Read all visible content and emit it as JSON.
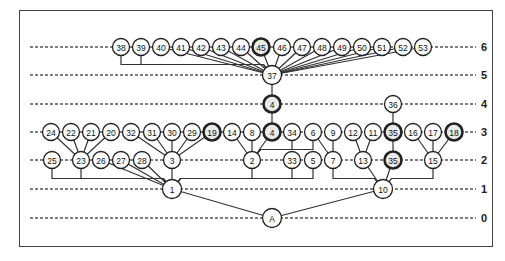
{
  "diagram": {
    "type": "hierarchical-tree",
    "levels": [
      {
        "label": "6",
        "y": 47
      },
      {
        "label": "5",
        "y": 75
      },
      {
        "label": "4",
        "y": 104
      },
      {
        "label": "3",
        "y": 132
      },
      {
        "label": "2",
        "y": 160
      },
      {
        "label": "1",
        "y": 189
      },
      {
        "label": "0",
        "y": 218
      }
    ],
    "nodes": [
      {
        "id": "38",
        "label": "38",
        "level": 6,
        "x": 121
      },
      {
        "id": "39",
        "label": "39",
        "level": 6,
        "x": 141
      },
      {
        "id": "40",
        "label": "40",
        "level": 6,
        "x": 161
      },
      {
        "id": "41",
        "label": "41",
        "level": 6,
        "x": 181
      },
      {
        "id": "42",
        "label": "42",
        "level": 6,
        "x": 201
      },
      {
        "id": "43",
        "label": "43",
        "level": 6,
        "x": 221
      },
      {
        "id": "44",
        "label": "44",
        "level": 6,
        "x": 241
      },
      {
        "id": "45",
        "label": "45",
        "level": 6,
        "x": 261,
        "dark": true
      },
      {
        "id": "46",
        "label": "46",
        "level": 6,
        "x": 282
      },
      {
        "id": "47",
        "label": "47",
        "level": 6,
        "x": 302
      },
      {
        "id": "48",
        "label": "48",
        "level": 6,
        "x": 322
      },
      {
        "id": "49",
        "label": "49",
        "level": 6,
        "x": 342
      },
      {
        "id": "50",
        "label": "50",
        "level": 6,
        "x": 362
      },
      {
        "id": "51",
        "label": "51",
        "level": 6,
        "x": 382
      },
      {
        "id": "52",
        "label": "52",
        "level": 6,
        "x": 403
      },
      {
        "id": "53",
        "label": "53",
        "level": 6,
        "x": 423
      },
      {
        "id": "37",
        "label": "37",
        "level": 5,
        "x": 272
      },
      {
        "id": "4a",
        "label": "4",
        "level": 4,
        "x": 272,
        "dark": true
      },
      {
        "id": "36",
        "label": "36",
        "level": 4,
        "x": 393
      },
      {
        "id": "24",
        "label": "24",
        "level": 3,
        "x": 51
      },
      {
        "id": "22",
        "label": "22",
        "level": 3,
        "x": 71
      },
      {
        "id": "21",
        "label": "21",
        "level": 3,
        "x": 91
      },
      {
        "id": "20",
        "label": "20",
        "level": 3,
        "x": 111
      },
      {
        "id": "32",
        "label": "32",
        "level": 3,
        "x": 131
      },
      {
        "id": "31",
        "label": "31",
        "level": 3,
        "x": 152
      },
      {
        "id": "30",
        "label": "30",
        "level": 3,
        "x": 172
      },
      {
        "id": "29",
        "label": "29",
        "level": 3,
        "x": 192
      },
      {
        "id": "19",
        "label": "19",
        "level": 3,
        "x": 212,
        "dark": true
      },
      {
        "id": "14",
        "label": "14",
        "level": 3,
        "x": 232
      },
      {
        "id": "8",
        "label": "8",
        "level": 3,
        "x": 252
      },
      {
        "id": "4b",
        "label": "4",
        "level": 3,
        "x": 272,
        "dark": true
      },
      {
        "id": "34",
        "label": "34",
        "level": 3,
        "x": 292
      },
      {
        "id": "6",
        "label": "6",
        "level": 3,
        "x": 313
      },
      {
        "id": "9",
        "label": "9",
        "level": 3,
        "x": 333
      },
      {
        "id": "12",
        "label": "12",
        "level": 3,
        "x": 353
      },
      {
        "id": "11",
        "label": "11",
        "level": 3,
        "x": 373
      },
      {
        "id": "35a",
        "label": "35",
        "level": 3,
        "x": 393,
        "dark": true
      },
      {
        "id": "16",
        "label": "16",
        "level": 3,
        "x": 413
      },
      {
        "id": "17",
        "label": "17",
        "level": 3,
        "x": 433
      },
      {
        "id": "18",
        "label": "18",
        "level": 3,
        "x": 454,
        "dark": true
      },
      {
        "id": "25",
        "label": "25",
        "level": 2,
        "x": 52
      },
      {
        "id": "23",
        "label": "23",
        "level": 2,
        "x": 81
      },
      {
        "id": "26",
        "label": "26",
        "level": 2,
        "x": 101
      },
      {
        "id": "27",
        "label": "27",
        "level": 2,
        "x": 121
      },
      {
        "id": "28",
        "label": "28",
        "level": 2,
        "x": 142
      },
      {
        "id": "3",
        "label": "3",
        "level": 2,
        "x": 172
      },
      {
        "id": "2",
        "label": "2",
        "level": 2,
        "x": 252
      },
      {
        "id": "33",
        "label": "33",
        "level": 2,
        "x": 292
      },
      {
        "id": "5",
        "label": "5",
        "level": 2,
        "x": 313
      },
      {
        "id": "7",
        "label": "7",
        "level": 2,
        "x": 333
      },
      {
        "id": "13",
        "label": "13",
        "level": 2,
        "x": 363
      },
      {
        "id": "35b",
        "label": "35",
        "level": 2,
        "x": 393,
        "dark": true
      },
      {
        "id": "15",
        "label": "15",
        "level": 2,
        "x": 433
      },
      {
        "id": "1",
        "label": "1",
        "level": 1,
        "x": 172
      },
      {
        "id": "10",
        "label": "10",
        "level": 1,
        "x": 383
      },
      {
        "id": "A",
        "label": "A",
        "level": 0,
        "x": 272
      }
    ],
    "edges": [
      [
        "38",
        "37",
        "elbow"
      ],
      [
        "39",
        "37",
        "elbow"
      ],
      [
        "40",
        "37"
      ],
      [
        "41",
        "37"
      ],
      [
        "42",
        "37"
      ],
      [
        "43",
        "37"
      ],
      [
        "44",
        "37"
      ],
      [
        "45",
        "37"
      ],
      [
        "46",
        "37"
      ],
      [
        "47",
        "37"
      ],
      [
        "48",
        "37"
      ],
      [
        "49",
        "37"
      ],
      [
        "50",
        "37"
      ],
      [
        "51",
        "37"
      ],
      [
        "52",
        "37"
      ],
      [
        "53",
        "37"
      ],
      [
        "37",
        "4a"
      ],
      [
        "4a",
        "4b"
      ],
      [
        "36",
        "35a"
      ],
      [
        "35a",
        "35b"
      ],
      [
        "24",
        "23"
      ],
      [
        "22",
        "23"
      ],
      [
        "21",
        "23"
      ],
      [
        "20",
        "23"
      ],
      [
        "32",
        "3"
      ],
      [
        "31",
        "3"
      ],
      [
        "30",
        "3"
      ],
      [
        "29",
        "3"
      ],
      [
        "19",
        "3"
      ],
      [
        "14",
        "2"
      ],
      [
        "8",
        "2"
      ],
      [
        "4b",
        "2"
      ],
      [
        "34",
        "2",
        "elbow"
      ],
      [
        "6",
        "2",
        "elbow"
      ],
      [
        "6",
        "7"
      ],
      [
        "9",
        "7"
      ],
      [
        "12",
        "13"
      ],
      [
        "11",
        "13"
      ],
      [
        "16",
        "15"
      ],
      [
        "17",
        "15"
      ],
      [
        "18",
        "15"
      ],
      [
        "25",
        "1",
        "elbow"
      ],
      [
        "23",
        "1",
        "elbow"
      ],
      [
        "26",
        "1"
      ],
      [
        "27",
        "1"
      ],
      [
        "28",
        "1"
      ],
      [
        "3",
        "1"
      ],
      [
        "2",
        "1",
        "elbow"
      ],
      [
        "33",
        "1",
        "elbow"
      ],
      [
        "5",
        "1",
        "elbow"
      ],
      [
        "7",
        "10",
        "elbow"
      ],
      [
        "13",
        "10"
      ],
      [
        "35b",
        "10"
      ],
      [
        "15",
        "10",
        "elbow"
      ],
      [
        "1",
        "A"
      ],
      [
        "10",
        "A"
      ]
    ]
  }
}
